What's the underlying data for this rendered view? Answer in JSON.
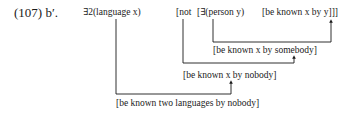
{
  "example": {
    "number": "(107)",
    "sub": "b′."
  },
  "formula": {
    "quantifier1": "∃2(language x)",
    "negation": "[not",
    "quantifier2": "[∃(person y)",
    "core": "[be known x by y]]]"
  },
  "derivations": [
    {
      "id": "step1",
      "text": "[be known x by somebody]"
    },
    {
      "id": "step2",
      "text": "[be known x by nobody]"
    },
    {
      "id": "step3",
      "text": "[be known two languages by nobody]"
    }
  ],
  "colors": {
    "ink": "#1a1a1a",
    "background": "#ffffff"
  }
}
